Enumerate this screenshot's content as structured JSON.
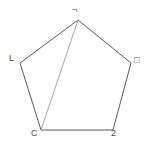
{
  "figure": {
    "kind": "geometry-diagram",
    "shape": "pentagon",
    "background_color": "#ffffff",
    "canvas": {
      "width": 153,
      "height": 152
    },
    "outline_color": "#5a5a5a",
    "diagonal_color": "#a6a6a6",
    "label_color": "#4a4a4a",
    "stroke_width": 1,
    "vertices": [
      {
        "id": "apex",
        "label": "¬",
        "x": 78,
        "y": 20
      },
      {
        "id": "right",
        "label": "□",
        "x": 131,
        "y": 63
      },
      {
        "id": "botright",
        "label": "2",
        "x": 113,
        "y": 130
      },
      {
        "id": "botleft",
        "label": "C",
        "x": 41,
        "y": 130
      },
      {
        "id": "left",
        "label": "L",
        "x": 20,
        "y": 63
      }
    ],
    "edges": [
      {
        "from": "apex",
        "to": "right",
        "style": "outline"
      },
      {
        "from": "right",
        "to": "botright",
        "style": "outline"
      },
      {
        "from": "botright",
        "to": "botleft",
        "style": "outline"
      },
      {
        "from": "botleft",
        "to": "left",
        "style": "outline"
      },
      {
        "from": "left",
        "to": "apex",
        "style": "outline"
      }
    ],
    "diagonals": [
      {
        "from": "apex",
        "to": "botleft",
        "style": "light"
      }
    ]
  }
}
